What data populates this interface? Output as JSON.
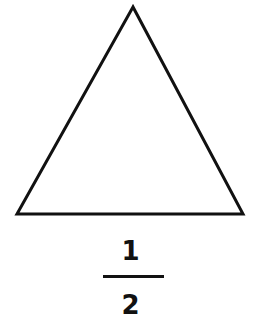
{
  "diagram": {
    "shape": "equilateral-triangle",
    "stroke_color": "#111111",
    "fill_color": "#ffffff",
    "vertices": [
      [
        133,
        7
      ],
      [
        17,
        214
      ],
      [
        243,
        214
      ]
    ]
  },
  "fraction": {
    "numerator": "1",
    "denominator": "2"
  }
}
